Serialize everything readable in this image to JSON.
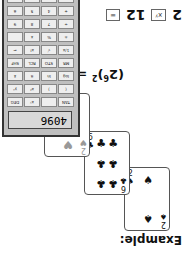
{
  "title": "Example:",
  "cards": [
    {
      "rank": "2",
      "suit": "♠",
      "color": "black"
    },
    {
      "rank": "6",
      "suit": "♣",
      "color": "black"
    },
    {
      "rank": "2",
      "suit": "♥",
      "color": "red"
    }
  ],
  "formula": {
    "base": "(2",
    "exp1": "6",
    "close": ")",
    "exp2": "2",
    "eq": " = 2",
    "exp3": "12"
  },
  "key_sequence": {
    "a": "2",
    "op": "xʸ",
    "b": "12",
    "eq": "="
  },
  "calculator": {
    "display": "4096",
    "keys": [
      "TAN",
      "",
      "xʸ",
      "DEG",
      "(",
      ")",
      "x²",
      "yˣ",
      "log",
      "ln",
      "π",
      "x̄",
      "MR",
      "STO",
      "RCL",
      "SHF",
      "1/x",
      "√",
      "x!",
      "←",
      "±",
      "%",
      "x",
      "",
      "÷",
      "7",
      "8",
      "9",
      "+",
      "4",
      "5",
      "6",
      "−",
      "1",
      "2",
      "3"
    ]
  }
}
